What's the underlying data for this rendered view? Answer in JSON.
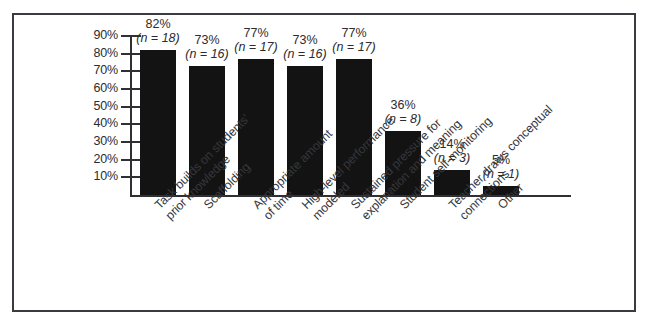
{
  "figure": {
    "frame_color": "#3a3a40",
    "bar_color": "#131313",
    "axis_color": "#2f2f34",
    "background": "#ffffff"
  },
  "chart_data": {
    "type": "bar",
    "title": "",
    "subtitle": "",
    "xlabel": "",
    "ylabel": "",
    "grid": false,
    "legend": "none",
    "ylim": [
      0,
      95
    ],
    "ytick_labels": [
      "90%",
      "80%",
      "70%",
      "60%",
      "50%",
      "40%",
      "30%",
      "20%",
      "10%"
    ],
    "ytick_values": [
      90,
      80,
      70,
      60,
      50,
      40,
      30,
      20,
      10
    ],
    "categories": [
      "Task builds on students'\nprior knowledge",
      "Scaffolding",
      "Appropriate amount\nof time",
      "High-level performance\nmodeled",
      "Sustained pressure for\nexplanation and meaning",
      "Student self-monitoring",
      "Teacher draws conceptual\nconnections",
      "Other"
    ],
    "values": [
      82,
      73,
      77,
      73,
      77,
      36,
      14,
      5
    ],
    "value_labels": [
      "82%",
      "73%",
      "77%",
      "73%",
      "77%",
      "36%",
      "14%",
      "5%"
    ],
    "n_labels": [
      "(n = 18)",
      "(n = 16)",
      "(n = 17)",
      "(n = 16)",
      "(n = 17)",
      "(n = 8)",
      "(n = 3)",
      "(n = 1)"
    ],
    "n_values": [
      18,
      16,
      17,
      16,
      17,
      8,
      3,
      1
    ]
  }
}
